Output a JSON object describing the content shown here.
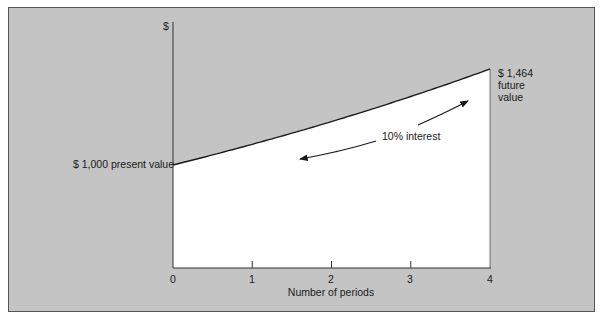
{
  "chart_data": {
    "type": "line",
    "title": "",
    "xlabel": "Number of periods",
    "ylabel": "$",
    "x": [
      0,
      1,
      2,
      3,
      4
    ],
    "series": [
      {
        "name": "Compound value at 10% interest",
        "values": [
          1000,
          1100,
          1210,
          1331,
          1464.1
        ]
      }
    ],
    "xlim": [
      0,
      4
    ],
    "annotations": [
      {
        "text": "$ 1,000 present value",
        "x": 0,
        "y": 1000
      },
      {
        "text": "$ 1,464 future value",
        "x": 4,
        "y": 1464
      },
      {
        "text": "10% interest",
        "note": "double arrow along curve: compounding forward, discounting backward"
      }
    ],
    "grid": false,
    "legend": "none"
  },
  "labels": {
    "y_axis": "$",
    "x_axis": "Number of periods",
    "x_ticks": [
      "0",
      "1",
      "2",
      "3",
      "4"
    ],
    "present_value": "$ 1,000 present value",
    "future_value_line1": "$ 1,464",
    "future_value_line2": "future",
    "future_value_line3": "value",
    "interest": "10% interest"
  },
  "colors": {
    "background": "#c4c4c4",
    "area_under_curve": "#ffffff",
    "line": "#1a1a1a"
  }
}
